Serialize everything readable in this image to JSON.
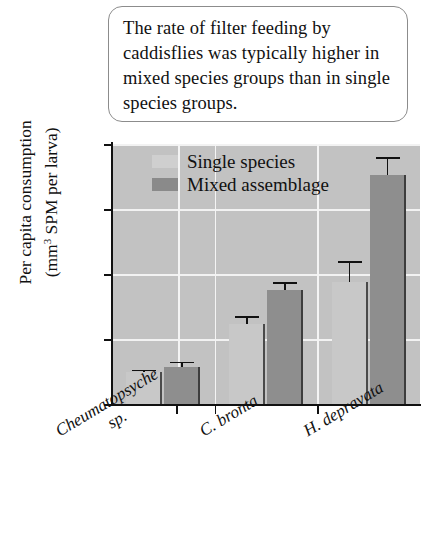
{
  "caption": {
    "text": "The rate of filter feeding by caddisflies was typically higher in mixed species groups than in single species groups."
  },
  "legend": {
    "items": [
      {
        "label": "Single species",
        "color": "#cfcfcf"
      },
      {
        "label": "Mixed assemblage",
        "color": "#8a8a8a"
      }
    ]
  },
  "axes": {
    "y_title_line1": "Per capita consumption",
    "y_title_line2_pre": "(mm",
    "y_title_line2_sup": "3",
    "y_title_line2_post": " SPM per larva)",
    "y_ticks": [
      "0",
      "0.2",
      "0.4",
      "0.6",
      "0.8"
    ]
  },
  "chart_data": {
    "type": "bar",
    "title": "",
    "xlabel": "",
    "ylabel": "Per capita consumption (mm3 SPM per larva)",
    "ylim": [
      0,
      0.8
    ],
    "yticks": [
      0,
      0.2,
      0.4,
      0.6,
      0.8
    ],
    "grid": "horizontal-and-vertical-white",
    "legend_position": "inside-top-left",
    "categories": [
      "Cheumatopsyche sp.",
      "C. bronta",
      "H. depravata"
    ],
    "category_lines": [
      [
        "Cheumatopsyche",
        "sp."
      ],
      [
        "C. bronta"
      ],
      [
        "H. depravata"
      ]
    ],
    "series": [
      {
        "name": "Single species",
        "color": "#cfcfcf",
        "values": [
          0.1,
          0.245,
          0.375
        ],
        "errors": [
          0.005,
          0.025,
          0.065
        ]
      },
      {
        "name": "Mixed assemblage",
        "color": "#8a8a8a",
        "values": [
          0.115,
          0.35,
          0.705
        ],
        "errors": [
          0.015,
          0.025,
          0.055
        ]
      }
    ]
  }
}
